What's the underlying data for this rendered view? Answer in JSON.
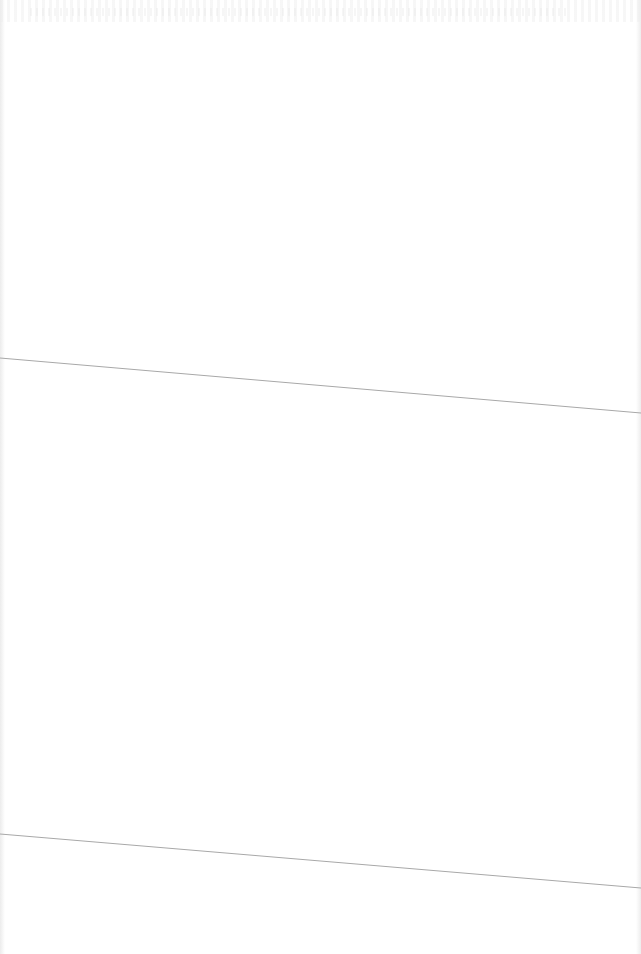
{
  "document": {
    "type": "scanned-blank-page",
    "background_color": "#ffffff",
    "fold_line_color": "#a8a8a8",
    "fold_lines": [
      {
        "x1": 0,
        "y1": 358,
        "x2": 641,
        "y2": 413
      },
      {
        "x1": 0,
        "y1": 834,
        "x2": 641,
        "y2": 888
      }
    ],
    "visible_text": ""
  }
}
